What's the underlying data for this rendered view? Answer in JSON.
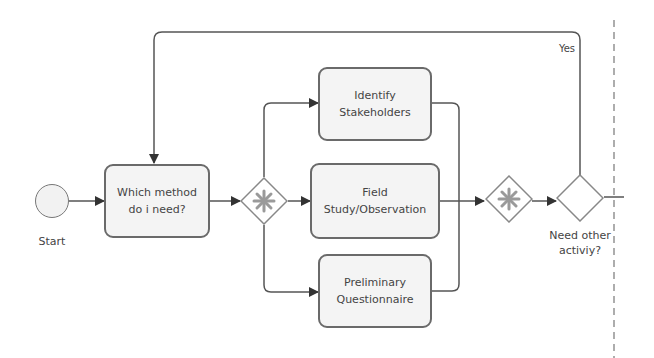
{
  "diagram": {
    "type": "BPMN process flow",
    "start_event": {
      "label": "Start"
    },
    "tasks": [
      {
        "id": "which-method",
        "label": "Which method do i need?"
      },
      {
        "id": "identify-stakeholders",
        "label": "Identify Stakeholders"
      },
      {
        "id": "field-study",
        "label": "Field Study/Observation"
      },
      {
        "id": "preliminary-questionnaire",
        "label": "Preliminary Questionnaire"
      }
    ],
    "gateways": [
      {
        "id": "split-gateway",
        "kind": "complex",
        "label": ""
      },
      {
        "id": "join-gateway",
        "kind": "complex",
        "label": ""
      },
      {
        "id": "decision-gateway",
        "kind": "exclusive",
        "label": "Need other activiy?"
      }
    ],
    "edges": [
      {
        "from": "start",
        "to": "which-method"
      },
      {
        "from": "which-method",
        "to": "split-gateway"
      },
      {
        "from": "split-gateway",
        "to": "identify-stakeholders"
      },
      {
        "from": "split-gateway",
        "to": "field-study"
      },
      {
        "from": "split-gateway",
        "to": "preliminary-questionnaire"
      },
      {
        "from": "identify-stakeholders",
        "to": "join-gateway"
      },
      {
        "from": "field-study",
        "to": "join-gateway"
      },
      {
        "from": "preliminary-questionnaire",
        "to": "join-gateway"
      },
      {
        "from": "join-gateway",
        "to": "decision-gateway"
      },
      {
        "from": "decision-gateway",
        "to": "which-method",
        "label": "Yes"
      }
    ],
    "labels": {
      "start": "Start",
      "task1_line1": "Which method",
      "task1_line2": "do i need?",
      "task2_line1": "Identify",
      "task2_line2": "Stakeholders",
      "task3_line1": "Field",
      "task3_line2": "Study/Observation",
      "task4_line1": "Preliminary",
      "task4_line2": "Questionnaire",
      "decision_line1": "Need other",
      "decision_line2": "activiy?",
      "yes_edge": "Yes"
    },
    "colors": {
      "stroke": "#555555",
      "task_fill": "#f4f4f4",
      "gateway_marker": "#999999"
    }
  }
}
